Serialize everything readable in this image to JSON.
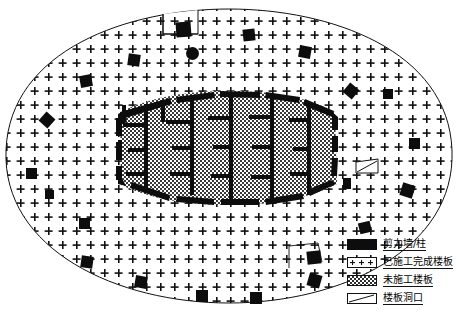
{
  "drawing": {
    "title": "",
    "type": "structural-floor-plan",
    "outline_shape": "ellipse-with-notch",
    "colors": {
      "wall": "#0d0d0d",
      "outline": "#111111",
      "completed_slab_fill": "#ffffff",
      "completed_slab_pattern": "plus-dot-sparse",
      "unbuilt_slab_fill": "#b3b3b3",
      "unbuilt_slab_pattern": "fine-checkerboard",
      "background": "#ffffff"
    }
  },
  "legend": {
    "name": "legend",
    "items": [
      {
        "swatch": "solid-black-bar",
        "label": "剪力墙/柱",
        "key": "shear-wall-column"
      },
      {
        "swatch": "dotted-plus-pattern",
        "label": "已施工完成楼板",
        "key": "completed-slab"
      },
      {
        "swatch": "checkerboard-pattern",
        "label": "未施工楼板",
        "key": "unbuilt-slab"
      },
      {
        "swatch": "parallelogram-outline",
        "label": "楼板洞口",
        "key": "slab-opening"
      }
    ]
  },
  "plan": {
    "outer_slab_region": "已施工完成楼板",
    "core_region": "未施工楼板",
    "opening_count": 1,
    "perimeter_columns": [
      {
        "x": 176,
        "y": 22,
        "w": 15,
        "h": 15,
        "shape": "square",
        "rot": -4
      },
      {
        "x": 186,
        "y": 47,
        "w": 13,
        "h": 13,
        "shape": "circle",
        "rot": 0
      },
      {
        "x": 128,
        "y": 54,
        "w": 12,
        "h": 12,
        "shape": "square",
        "rot": 8
      },
      {
        "x": 243,
        "y": 29,
        "w": 12,
        "h": 12,
        "shape": "square",
        "rot": -6
      },
      {
        "x": 299,
        "y": 46,
        "w": 12,
        "h": 12,
        "shape": "square",
        "rot": 10
      },
      {
        "x": 80,
        "y": 75,
        "w": 12,
        "h": 12,
        "shape": "square",
        "rot": -10
      },
      {
        "x": 345,
        "y": 85,
        "w": 12,
        "h": 12,
        "shape": "square",
        "rot": 40
      },
      {
        "x": 41,
        "y": 114,
        "w": 12,
        "h": 12,
        "shape": "square",
        "rot": 42
      },
      {
        "x": 26,
        "y": 168,
        "w": 11,
        "h": 11,
        "shape": "square",
        "rot": 0
      },
      {
        "x": 383,
        "y": 89,
        "w": 10,
        "h": 10,
        "shape": "square",
        "rot": 0
      },
      {
        "x": 409,
        "y": 138,
        "w": 11,
        "h": 11,
        "shape": "square",
        "rot": 0
      },
      {
        "x": 401,
        "y": 184,
        "w": 13,
        "h": 13,
        "shape": "square",
        "rot": 18
      },
      {
        "x": 343,
        "y": 178,
        "w": 8,
        "h": 11,
        "shape": "square",
        "rot": 0
      },
      {
        "x": 359,
        "y": 222,
        "w": 12,
        "h": 11,
        "shape": "square",
        "rot": -14
      },
      {
        "x": 79,
        "y": 218,
        "w": 11,
        "h": 11,
        "shape": "square",
        "rot": 0
      },
      {
        "x": 45,
        "y": 190,
        "w": 9,
        "h": 9,
        "shape": "square",
        "rot": 0
      },
      {
        "x": 81,
        "y": 256,
        "w": 12,
        "h": 12,
        "shape": "square",
        "rot": 8
      },
      {
        "x": 135,
        "y": 276,
        "w": 12,
        "h": 12,
        "shape": "square",
        "rot": 10
      },
      {
        "x": 196,
        "y": 290,
        "w": 12,
        "h": 12,
        "shape": "square",
        "rot": 0
      },
      {
        "x": 250,
        "y": 292,
        "w": 12,
        "h": 12,
        "shape": "square",
        "rot": 0
      },
      {
        "x": 308,
        "y": 274,
        "w": 13,
        "h": 13,
        "shape": "square",
        "rot": 16
      },
      {
        "x": 307,
        "y": 251,
        "w": 14,
        "h": 13,
        "shape": "square",
        "rot": -6
      },
      {
        "x": 42,
        "y": 163,
        "w": 0,
        "h": 0,
        "shape": "none",
        "rot": 0
      }
    ],
    "slab_opening": {
      "x": 356,
      "y": 160,
      "w": 22,
      "h": 14,
      "label": "楼板洞口"
    }
  }
}
